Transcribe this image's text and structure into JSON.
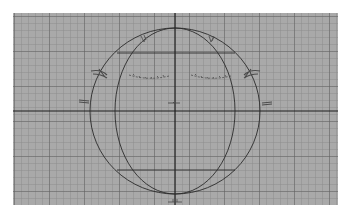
{
  "viewport": {
    "view": "front",
    "background_color": "#a9a9a9",
    "grid_color": "#6e6e6e",
    "axis_color": "#1e1e1e",
    "wire_color": "#2a2a2a",
    "grid": {
      "minor_spacing_px": 7,
      "major_every": 5
    },
    "origin": {
      "x": 162,
      "y": 98
    }
  },
  "objects": [
    {
      "name": "sphere-outer-silhouette",
      "type": "circle",
      "cx": 162,
      "cy": 98,
      "rx": 85,
      "ry": 83
    },
    {
      "name": "sphere-inner-meridian",
      "type": "ellipse",
      "cx": 162,
      "cy": 98,
      "rx": 60,
      "ry": 83
    },
    {
      "name": "upper-latitude-line",
      "type": "line",
      "y": 40,
      "x1": 104,
      "x2": 222
    },
    {
      "name": "lower-latitude-line",
      "type": "line",
      "y": 157,
      "x1": 104,
      "x2": 222
    }
  ],
  "reference_sketch": {
    "features": [
      "eyebrow-left",
      "eyebrow-right",
      "eye-left",
      "eye-right",
      "ear-left",
      "ear-right",
      "nose",
      "hair-tuft-left",
      "hair-tuft-right",
      "chin-mark"
    ]
  }
}
